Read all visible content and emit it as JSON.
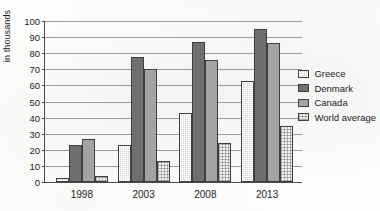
{
  "chart_data": {
    "type": "bar",
    "title": "",
    "subtitle": "",
    "xlabel": "",
    "ylabel": "in thousands",
    "categories": [
      "1998",
      "2003",
      "2008",
      "2013"
    ],
    "series": [
      {
        "name": "Greece",
        "values": [
          2.5,
          23,
          43,
          63
        ],
        "color": "#d5d2cc",
        "pattern": "fine-crosshatch"
      },
      {
        "name": "Denmark",
        "values": [
          23,
          77.5,
          87,
          95
        ],
        "color": "#6f6f6f",
        "pattern": "solid"
      },
      {
        "name": "Canada",
        "values": [
          27,
          70,
          76,
          86.5
        ],
        "color": "#a3a3a1",
        "pattern": "solid"
      },
      {
        "name": "World average",
        "values": [
          3.5,
          13,
          24.5,
          35
        ],
        "color": "#f4f3f0",
        "pattern": "dotted-grid"
      }
    ],
    "ylim": [
      0,
      100
    ],
    "ytick_step": 10,
    "yticks": [
      "100",
      "90",
      "80",
      "70",
      "60",
      "50",
      "40",
      "30",
      "20",
      "10",
      "0"
    ],
    "grid": "horizontal",
    "legend_position": "right"
  },
  "legend": {
    "items": [
      {
        "label": "Greece"
      },
      {
        "label": "Denmark"
      },
      {
        "label": "Canada"
      },
      {
        "label": "World average"
      }
    ]
  }
}
